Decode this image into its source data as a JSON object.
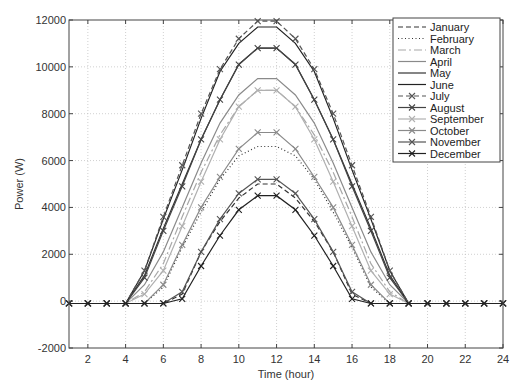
{
  "chart_data": {
    "type": "line",
    "title": "",
    "xlabel": "Time (hour)",
    "ylabel": "Power (W)",
    "xlim": [
      1,
      24
    ],
    "ylim": [
      -2000,
      12000
    ],
    "xticks": [
      2,
      4,
      6,
      8,
      10,
      12,
      14,
      16,
      18,
      20,
      22,
      24
    ],
    "yticks": [
      -2000,
      0,
      2000,
      4000,
      6000,
      8000,
      10000,
      12000
    ],
    "ytick_labels": [
      "-2000",
      "0",
      "2000",
      "4000",
      "6000",
      "8000",
      "10000",
      "12000"
    ],
    "grid": true,
    "legend_position": "upper right",
    "x": [
      1,
      2,
      3,
      4,
      5,
      6,
      7,
      8,
      9,
      10,
      11,
      12,
      13,
      14,
      15,
      16,
      17,
      18,
      19,
      20,
      21,
      22,
      23,
      24
    ],
    "series": [
      {
        "name": "January",
        "color": "#333333",
        "dash": "5,3",
        "marker": "none",
        "values": [
          -100,
          -100,
          -100,
          -100,
          -100,
          -100,
          300,
          2100,
          3400,
          4400,
          5000,
          5000,
          4400,
          3400,
          2100,
          300,
          -100,
          -100,
          -100,
          -100,
          -100,
          -100,
          -100,
          -100
        ]
      },
      {
        "name": "February",
        "color": "#333333",
        "dash": "1,2.5",
        "marker": "none",
        "values": [
          -100,
          -100,
          -100,
          -100,
          -100,
          600,
          2300,
          3800,
          5200,
          6200,
          6600,
          6600,
          6200,
          5200,
          3800,
          2300,
          600,
          -100,
          -100,
          -100,
          -100,
          -100,
          -100,
          -100
        ]
      },
      {
        "name": "March",
        "color": "#a8a8a8",
        "dash": "8,3,2,3",
        "marker": "none",
        "values": [
          -100,
          -100,
          -100,
          -100,
          400,
          1600,
          3600,
          5500,
          7100,
          8300,
          9000,
          9000,
          8300,
          7100,
          5500,
          3600,
          1600,
          400,
          -100,
          -100,
          -100,
          -100,
          -100,
          -100
        ]
      },
      {
        "name": "April",
        "color": "#8a8a8a",
        "dash": "",
        "marker": "none",
        "values": [
          -100,
          -100,
          -100,
          -100,
          700,
          2100,
          4000,
          5900,
          7600,
          8800,
          9500,
          9500,
          8800,
          7600,
          5900,
          4000,
          2100,
          700,
          -100,
          -100,
          -100,
          -100,
          -100,
          -100
        ]
      },
      {
        "name": "May",
        "color": "#333333",
        "dash": "",
        "marker": "none",
        "values": [
          -100,
          -100,
          -100,
          -100,
          1100,
          3100,
          5000,
          6900,
          8600,
          10100,
          10800,
          10800,
          10100,
          8600,
          6900,
          5000,
          3100,
          1100,
          -100,
          -100,
          -100,
          -100,
          -100,
          -100
        ]
      },
      {
        "name": "June",
        "color": "#222222",
        "dash": "",
        "marker": "none",
        "values": [
          -100,
          -100,
          -100,
          -100,
          1300,
          3500,
          5600,
          7800,
          9800,
          11000,
          11700,
          11700,
          11000,
          9800,
          7800,
          5600,
          3500,
          1300,
          -100,
          -100,
          -100,
          -100,
          -100,
          -100
        ]
      },
      {
        "name": "July",
        "color": "#555555",
        "dash": "5,3",
        "marker": "x",
        "values": [
          -100,
          -100,
          -100,
          -100,
          1300,
          3600,
          5800,
          8000,
          9900,
          11200,
          11950,
          11950,
          11200,
          9900,
          8000,
          5800,
          3600,
          1300,
          -100,
          -100,
          -100,
          -100,
          -100,
          -100
        ]
      },
      {
        "name": "August",
        "color": "#444444",
        "dash": "",
        "marker": "x",
        "values": [
          -100,
          -100,
          -100,
          -100,
          1000,
          3000,
          4900,
          6900,
          8600,
          10100,
          10800,
          10800,
          10100,
          8600,
          6900,
          4900,
          3000,
          1000,
          -100,
          -100,
          -100,
          -100,
          -100,
          -100
        ]
      },
      {
        "name": "September",
        "color": "#b0b0b0",
        "dash": "",
        "marker": "x",
        "values": [
          -100,
          -100,
          -100,
          -100,
          300,
          1300,
          3200,
          5100,
          6900,
          8300,
          9000,
          9000,
          8300,
          6900,
          5100,
          3200,
          1300,
          300,
          -100,
          -100,
          -100,
          -100,
          -100,
          -100
        ]
      },
      {
        "name": "October",
        "color": "#8a8a8a",
        "dash": "",
        "marker": "x",
        "values": [
          -100,
          -100,
          -100,
          -100,
          -100,
          700,
          2400,
          4000,
          5300,
          6500,
          7200,
          7200,
          6500,
          5300,
          4000,
          2400,
          700,
          -100,
          -100,
          -100,
          -100,
          -100,
          -100,
          -100
        ]
      },
      {
        "name": "November",
        "color": "#555555",
        "dash": "",
        "marker": "x",
        "values": [
          -100,
          -100,
          -100,
          -100,
          -100,
          -100,
          400,
          2100,
          3500,
          4600,
          5200,
          5200,
          4600,
          3500,
          2100,
          400,
          -100,
          -100,
          -100,
          -100,
          -100,
          -100,
          -100,
          -100
        ]
      },
      {
        "name": "December",
        "color": "#222222",
        "dash": "",
        "marker": "x",
        "values": [
          -100,
          -100,
          -100,
          -100,
          -100,
          -100,
          100,
          1500,
          2800,
          3900,
          4500,
          4500,
          3900,
          2800,
          1500,
          100,
          -100,
          -100,
          -100,
          -100,
          -100,
          -100,
          -100,
          -100
        ]
      }
    ]
  }
}
